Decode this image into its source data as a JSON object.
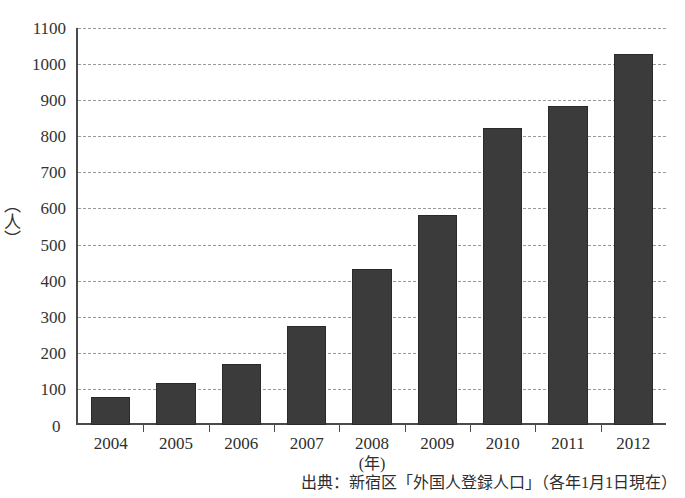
{
  "chart_data": {
    "type": "bar",
    "title": "",
    "xlabel": "(年)",
    "ylabel": "（人）",
    "categories": [
      "2004",
      "2005",
      "2006",
      "2007",
      "2008",
      "2009",
      "2010",
      "2011",
      "2012"
    ],
    "values": [
      77,
      117,
      170,
      275,
      433,
      583,
      822,
      885,
      1027
    ],
    "ylim": [
      0,
      1100
    ],
    "ytick_step": 100,
    "yticks": [
      0,
      100,
      200,
      300,
      400,
      500,
      600,
      700,
      800,
      900,
      1000,
      1100
    ],
    "ytick_labels": [
      "0",
      "100",
      "200",
      "300",
      "400",
      "500",
      "600",
      "700",
      "800",
      "900",
      "1000",
      "1100"
    ],
    "grid": true,
    "grid_style": "dashed",
    "legend": false,
    "series": [
      {
        "name": "外国人登録人口",
        "values": [
          77,
          117,
          170,
          275,
          433,
          583,
          822,
          885,
          1027
        ]
      }
    ],
    "bar_color": "#3b3b3b",
    "axis_color": "#4a4a4a",
    "grid_color": "#9a9a9a"
  },
  "annotations": {
    "source_note": "出典：新宿区「外国人登録人口」（各年1月1日現在）",
    "x_axis_caption": "(年)",
    "y_axis_caption": "（人）",
    "zero_label": "0"
  }
}
